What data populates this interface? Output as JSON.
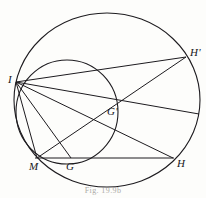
{
  "figure": {
    "caption": "Fig. 19.9b",
    "stroke_color": "#1d1b1f",
    "background_color": "#fdfdfb",
    "labels": [
      {
        "name": "point-label-I",
        "text": "I",
        "x": 8,
        "y": 74
      },
      {
        "name": "point-label-H-prime",
        "text": "H'",
        "x": 190,
        "y": 47
      },
      {
        "name": "point-label-G-prime",
        "text": "G'",
        "x": 107,
        "y": 106
      },
      {
        "name": "point-label-M",
        "text": "M",
        "x": 29,
        "y": 161
      },
      {
        "name": "point-label-G",
        "text": "G",
        "x": 66,
        "y": 161
      },
      {
        "name": "point-label-H",
        "text": "H",
        "x": 177,
        "y": 158
      }
    ],
    "points": {
      "I": {
        "x": 16,
        "y": 82
      },
      "H_prime": {
        "x": 186,
        "y": 57
      },
      "G_prime": {
        "x": 112,
        "y": 113
      },
      "M": {
        "x": 37,
        "y": 158
      },
      "G": {
        "x": 71,
        "y": 158
      },
      "H": {
        "x": 173,
        "y": 158
      }
    },
    "circles": [
      {
        "name": "large-circumcircle",
        "cx": 107,
        "cy": 100,
        "rx": 93,
        "ry": 87
      },
      {
        "name": "small-circle",
        "cx": 67,
        "cy": 112,
        "rx": 51,
        "ry": 52
      }
    ],
    "segments": [
      {
        "name": "segment-I-H-prime",
        "from": "I",
        "to": "H_prime"
      },
      {
        "name": "segment-I-G-prime-H",
        "from": "I",
        "to": "H"
      },
      {
        "name": "segment-I-G",
        "from": "I",
        "to": "G"
      },
      {
        "name": "segment-I-M",
        "from": "I",
        "to": "M"
      },
      {
        "name": "segment-M-G-prime-H-prime",
        "from": "M",
        "to": "H_prime"
      },
      {
        "name": "segment-M-H",
        "from": "M",
        "to": "H"
      },
      {
        "name": "segment-I-right-chord",
        "from": "I",
        "to": "H_prime_low"
      }
    ]
  }
}
